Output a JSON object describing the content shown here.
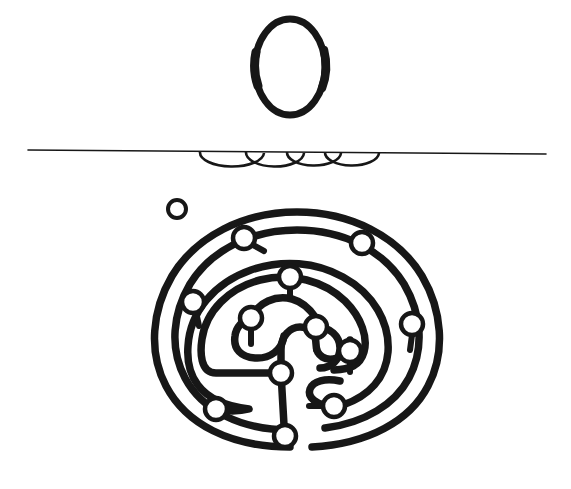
{
  "figure": {
    "title": "Labyrinth line drawing",
    "background_color": "#ffffff",
    "ink_color": "#171717",
    "width": 571,
    "height": 489
  },
  "top_mark": {
    "name": "letter-o-ellipse",
    "shape": "ellipse-outline",
    "center_x": 290,
    "center_y": 67,
    "radius_x": 35,
    "radius_y": 48,
    "stroke_width": 7
  },
  "rule": {
    "name": "horizontal-rule",
    "x1": 28,
    "y1": 150,
    "x2": 546,
    "y2": 154,
    "stroke_width": 1.6
  },
  "pendant_arcs": {
    "name": "pendant-arc-row",
    "count": 4,
    "baseline_y": 153,
    "stroke_width": 2.6,
    "arcs": [
      {
        "cx": 232,
        "rx": 32,
        "ry": 14
      },
      {
        "cx": 275,
        "rx": 29,
        "ry": 14
      },
      {
        "cx": 314,
        "rx": 27,
        "ry": 13
      },
      {
        "cx": 352,
        "rx": 27,
        "ry": 13
      }
    ]
  },
  "stray_ring": {
    "name": "detached-ring",
    "center_x": 177,
    "center_y": 209,
    "radius": 9,
    "stroke_width": 4
  },
  "labyrinth": {
    "name": "seven-circuit-labyrinth",
    "center_x": 297,
    "center_y": 325,
    "outer_radius_x": 140,
    "outer_radius_y": 122,
    "circuit_count": 7,
    "path_stroke_width": 7.5,
    "node_radius": 11,
    "node_stroke_width": 4.5,
    "entrance": "bottom-center",
    "nodes": [
      {
        "label": "top-left-outer",
        "x": 244,
        "y": 238
      },
      {
        "label": "top-right-outer",
        "x": 362,
        "y": 243
      },
      {
        "label": "upper-center",
        "x": 290,
        "y": 277
      },
      {
        "label": "left-mid",
        "x": 193,
        "y": 302
      },
      {
        "label": "right-mid",
        "x": 412,
        "y": 324
      },
      {
        "label": "inner-left",
        "x": 251,
        "y": 318
      },
      {
        "label": "inner-right",
        "x": 316,
        "y": 327
      },
      {
        "label": "inner-lower-right",
        "x": 350,
        "y": 351
      },
      {
        "label": "core-junction",
        "x": 281,
        "y": 373
      },
      {
        "label": "bottom-left",
        "x": 216,
        "y": 409
      },
      {
        "label": "bottom-right",
        "x": 334,
        "y": 406
      },
      {
        "label": "entrance",
        "x": 285,
        "y": 436
      }
    ]
  }
}
